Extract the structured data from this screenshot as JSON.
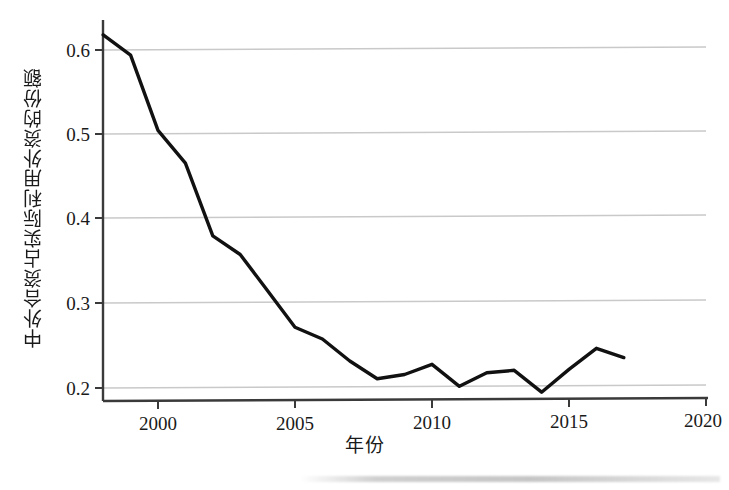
{
  "chart_data": {
    "type": "line",
    "title": "",
    "xlabel": "年份",
    "ylabel": "中外合资占实际利用外资的份额",
    "x": [
      1998,
      1999,
      2000,
      2001,
      2002,
      2003,
      2004,
      2005,
      2006,
      2007,
      2008,
      2009,
      2010,
      2011,
      2012,
      2013,
      2014,
      2015,
      2016,
      2017
    ],
    "values": [
      0.618,
      0.594,
      0.505,
      0.466,
      0.38,
      0.358,
      0.315,
      0.272,
      0.258,
      0.232,
      0.211,
      0.216,
      0.228,
      0.202,
      0.218,
      0.221,
      0.195,
      0.222,
      0.247,
      0.236
    ],
    "series": [
      {
        "name": "中外合资占实际利用外资的份额",
        "values": [
          0.618,
          0.594,
          0.505,
          0.466,
          0.38,
          0.358,
          0.315,
          0.272,
          0.258,
          0.232,
          0.211,
          0.216,
          0.228,
          0.202,
          0.218,
          0.221,
          0.195,
          0.222,
          0.247,
          0.236
        ]
      }
    ],
    "xlim": [
      1998,
      2020
    ],
    "ylim": [
      0.185,
      0.625
    ],
    "xticks": [
      2000,
      2005,
      2010,
      2015,
      2020
    ],
    "xtick_labels": [
      "2000",
      "2005",
      "2010",
      "2015",
      "2020"
    ],
    "yticks": [
      0.2,
      0.3,
      0.4,
      0.5,
      0.6
    ],
    "ytick_labels": [
      "0.2",
      "0.3",
      "0.4",
      "0.5",
      "0.6"
    ],
    "grid": "horizontal",
    "legend": "none",
    "line_color": "#111111",
    "grid_color": "#c9c9c9",
    "axis_color": "#3a3a3a",
    "background_color": "#ffffff"
  }
}
